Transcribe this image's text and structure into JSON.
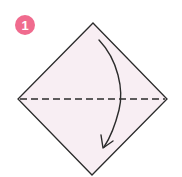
{
  "step": {
    "number": "1",
    "badge_color": "#f06b8e"
  },
  "diagram": {
    "paper_fill": "#f8eef3",
    "stroke_color": "#2b2b2b",
    "shape": "diamond",
    "fold_line": "dashed-horizontal-diagonal",
    "arrow_direction": "top-to-bottom"
  }
}
